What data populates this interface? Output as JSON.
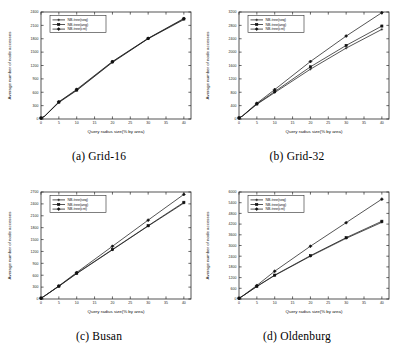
{
  "figure": {
    "axis_titles": {
      "y": "Average number of node accesses",
      "x": "Query radius size(% by area)"
    },
    "legend_entries": [
      "NB-tree(seq)",
      "NB-tree(ang)",
      "NB-tree(cnt)"
    ],
    "captions": {
      "a": "(a) Grid-16",
      "b": "(b) Grid-32",
      "c": "(c) Busan",
      "d": "(d) Oldenburg"
    }
  },
  "chart_data": [
    {
      "type": "line",
      "title": "(a) Grid-16",
      "xlabel": "Query radius size(% by area)",
      "ylabel": "Average number of node accesses",
      "x": [
        0,
        1,
        5,
        10,
        20,
        30,
        40
      ],
      "xlim": [
        0,
        42
      ],
      "ylim": [
        0,
        2400
      ],
      "xticks": [
        0,
        5,
        10,
        15,
        20,
        25,
        30,
        35,
        40
      ],
      "yticks": [
        0,
        300,
        600,
        900,
        1200,
        1500,
        1800,
        2100,
        2400
      ],
      "grid": false,
      "legend_position": "top-left",
      "series": [
        {
          "name": "NB-tree(seq)",
          "values": [
            20,
            60,
            370,
            640,
            1270,
            1800,
            2230
          ]
        },
        {
          "name": "NB-tree(ang)",
          "values": [
            20,
            60,
            380,
            650,
            1280,
            1805,
            2245
          ]
        },
        {
          "name": "NB-tree(cnt)",
          "values": [
            20,
            62,
            385,
            665,
            1290,
            1810,
            2255
          ]
        }
      ]
    },
    {
      "type": "line",
      "title": "(b) Grid-32",
      "xlabel": "Query radius size(% by area)",
      "ylabel": "Average number of node accesses",
      "x": [
        0,
        1,
        5,
        10,
        20,
        30,
        40
      ],
      "xlim": [
        0,
        42
      ],
      "ylim": [
        0,
        3200
      ],
      "xticks": [
        0,
        5,
        10,
        15,
        20,
        25,
        30,
        35,
        40
      ],
      "yticks": [
        0,
        400,
        800,
        1200,
        1600,
        2000,
        2400,
        2800,
        3200
      ],
      "grid": false,
      "legend_position": "top-left",
      "series": [
        {
          "name": "NB-tree(seq)",
          "values": [
            30,
            90,
            440,
            790,
            1490,
            2120,
            2680
          ]
        },
        {
          "name": "NB-tree(ang)",
          "values": [
            30,
            92,
            450,
            820,
            1560,
            2200,
            2780
          ]
        },
        {
          "name": "NB-tree(cnt)",
          "values": [
            30,
            95,
            470,
            880,
            1720,
            2480,
            3180
          ]
        }
      ]
    },
    {
      "type": "line",
      "title": "(c) Busan",
      "xlabel": "Query radius size(% by area)",
      "ylabel": "Average number of node accesses",
      "x": [
        0,
        1,
        5,
        10,
        20,
        30,
        40
      ],
      "xlim": [
        0,
        42
      ],
      "ylim": [
        0,
        2700
      ],
      "xticks": [
        0,
        5,
        10,
        15,
        20,
        25,
        30,
        35,
        40
      ],
      "yticks": [
        0,
        300,
        600,
        900,
        1200,
        1500,
        1800,
        2100,
        2400,
        2700
      ],
      "grid": false,
      "legend_position": "top-left",
      "series": [
        {
          "name": "NB-tree(seq)",
          "values": [
            20,
            75,
            320,
            640,
            1240,
            1840,
            2420
          ]
        },
        {
          "name": "NB-tree(ang)",
          "values": [
            20,
            76,
            325,
            650,
            1250,
            1850,
            2440
          ]
        },
        {
          "name": "NB-tree(cnt)",
          "values": [
            20,
            78,
            330,
            670,
            1330,
            1990,
            2640
          ]
        }
      ]
    },
    {
      "type": "line",
      "title": "(d) Oldenburg",
      "xlabel": "Query radius size(% by area)",
      "ylabel": "Average number of node accesses",
      "x": [
        0,
        1,
        5,
        10,
        20,
        30,
        40
      ],
      "xlim": [
        0,
        42
      ],
      "ylim": [
        0,
        6000
      ],
      "xticks": [
        0,
        5,
        10,
        15,
        20,
        25,
        30,
        35,
        40
      ],
      "yticks": [
        0,
        600,
        1200,
        1800,
        2400,
        3000,
        3600,
        4200,
        4800,
        5400,
        6000
      ],
      "grid": false,
      "legend_position": "top-left",
      "series": [
        {
          "name": "NB-tree(seq)",
          "values": [
            40,
            160,
            700,
            1320,
            2400,
            3400,
            4300
          ]
        },
        {
          "name": "NB-tree(ang)",
          "values": [
            40,
            162,
            710,
            1340,
            2430,
            3440,
            4360
          ]
        },
        {
          "name": "NB-tree(cnt)",
          "values": [
            40,
            170,
            760,
            1560,
            2960,
            4280,
            5600
          ]
        }
      ]
    }
  ]
}
